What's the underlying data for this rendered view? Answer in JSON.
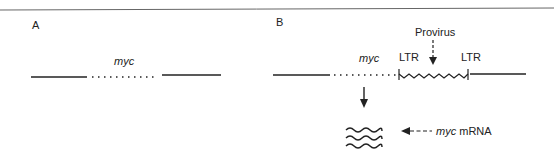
{
  "panel_a": {
    "label": "A",
    "gene_label": "myc"
  },
  "panel_b": {
    "label": "B",
    "gene_label": "myc",
    "ltr_left": "LTR",
    "ltr_right": "LTR",
    "provirus_label": "Provirus",
    "mrna_label_italic": "myc",
    "mrna_label_rest": " mRNA"
  },
  "colors": {
    "line": "#222222",
    "border": "#555555"
  }
}
